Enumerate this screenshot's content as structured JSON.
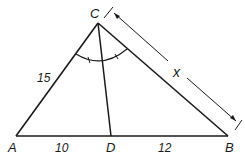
{
  "diagram": {
    "type": "triangle-angle-bisector",
    "vertices": {
      "A": {
        "label": "A"
      },
      "B": {
        "label": "B"
      },
      "C": {
        "label": "C"
      },
      "D": {
        "label": "D"
      }
    },
    "side_labels": {
      "AC": "15",
      "AD": "10",
      "DB": "12",
      "CB": "x"
    },
    "colors": {
      "stroke": "#1a1a1a",
      "background": "#ffffff"
    }
  }
}
